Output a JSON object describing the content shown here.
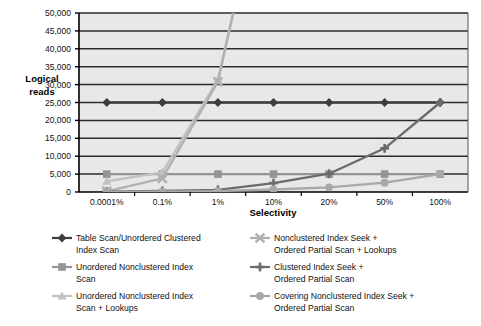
{
  "chart_data": {
    "type": "line",
    "title": "",
    "xlabel": "Selectivity",
    "ylabel": "Logical reads",
    "categories": [
      "0.0001%",
      "0.1%",
      "1%",
      "10%",
      "20%",
      "50%",
      "100%"
    ],
    "ylim": [
      0,
      50000
    ],
    "ytick_labels": [
      "0",
      "5,000",
      "10,000",
      "15,000",
      "20,000",
      "25,000",
      "30,000",
      "35,000",
      "40,000",
      "45,000",
      "50,000"
    ],
    "ytick_values": [
      0,
      5000,
      10000,
      15000,
      20000,
      25000,
      30000,
      35000,
      40000,
      45000,
      50000
    ],
    "grid": true,
    "legend_position": "bottom",
    "series": [
      {
        "name": "Table Scan/Unordered Clustered Index Scan",
        "marker": "diamond",
        "color": "#3d3d3d",
        "values": [
          25000,
          25000,
          25000,
          25000,
          25000,
          25000,
          25000
        ]
      },
      {
        "name": "Unordered Nonclustered Index Scan",
        "marker": "square",
        "color": "#949494",
        "values": [
          5000,
          5000,
          5000,
          5000,
          5000,
          5000,
          5000
        ]
      },
      {
        "name": "Unordered Nonclustered Index Scan + Lookups",
        "marker": "triangle",
        "color": "#c2c2c2",
        "values": [
          3000,
          5500,
          31500,
          99999,
          99999,
          99999,
          99999
        ]
      },
      {
        "name": "Nonclustered Index Seek + Ordered Partial Scan + Lookups",
        "marker": "cross",
        "color": "#b0b0b0",
        "values": [
          200,
          3800,
          30800,
          99999,
          99999,
          99999,
          99999
        ]
      },
      {
        "name": "Clustered Index Seek + Ordered Partial Scan",
        "marker": "plus",
        "color": "#6b6b6b",
        "values": [
          100,
          300,
          600,
          2500,
          5100,
          12200,
          25000
        ]
      },
      {
        "name": "Covering Nonclustered Index Seek + Ordered Partial Scan",
        "marker": "circle",
        "color": "#a8a8a8",
        "values": [
          50,
          120,
          250,
          700,
          1300,
          2600,
          5000
        ]
      }
    ]
  },
  "legend": {
    "items": [
      {
        "label_line1": "Table Scan/Unordered Clustered",
        "label_line2": "Index Scan"
      },
      {
        "label_line1": "Unordered Nonclustered Index",
        "label_line2": "Scan"
      },
      {
        "label_line1": "Unordered Nonclustered Index",
        "label_line2": "Scan + Lookups"
      },
      {
        "label_line1": "Nonclustered Index Seek +",
        "label_line2": "Ordered Partial Scan + Lookups"
      },
      {
        "label_line1": "Clustered Index Seek +",
        "label_line2": "Ordered Partial Scan"
      },
      {
        "label_line1": "Covering Nonclustered Index Seek +",
        "label_line2": "Ordered Partial Scan"
      }
    ]
  },
  "colors": {
    "plot_background": "#e8e8e8",
    "grid_line": "#2b2b2b",
    "axis_line": "#000000",
    "page_background": "#ffffff"
  }
}
